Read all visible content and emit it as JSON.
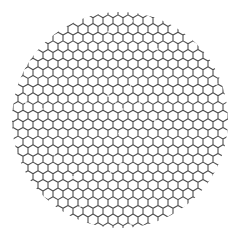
{
  "figure": {
    "background_color": "#ffffff",
    "line_color": "#2e2e2e",
    "line_width": 1.1,
    "line_opacity": 0.85,
    "circle": {
      "cx": 120,
      "cy": 120,
      "r": 108
    },
    "hexagon": {
      "orientation": "pointy-top",
      "width": 10,
      "row_spacing": 8.66,
      "origin_x": 3,
      "origin_y": 12
    }
  }
}
